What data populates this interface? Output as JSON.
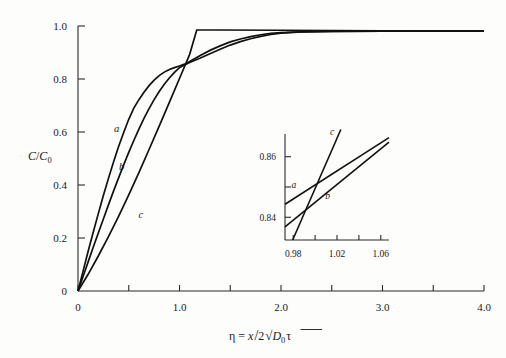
{
  "chart_data": {
    "type": "line",
    "title": "",
    "xlabel": "η = x/2√(D₀τ)",
    "ylabel": "C/C₀",
    "xlim": [
      0,
      4.0
    ],
    "ylim": [
      0,
      1.0
    ],
    "grid": false,
    "legend_position": "inline-curve-labels",
    "x_ticks": [
      {
        "value": 0,
        "label": "0"
      },
      {
        "value": 0.5,
        "label": ""
      },
      {
        "value": 1.0,
        "label": "1.0"
      },
      {
        "value": 1.5,
        "label": ""
      },
      {
        "value": 2.0,
        "label": "2.0"
      },
      {
        "value": 2.5,
        "label": ""
      },
      {
        "value": 3.0,
        "label": "3.0"
      },
      {
        "value": 3.5,
        "label": ""
      },
      {
        "value": 4.0,
        "label": "4.0"
      }
    ],
    "y_ticks": [
      {
        "value": 0,
        "label": "0"
      },
      {
        "value": 0.2,
        "label": "0.2"
      },
      {
        "value": 0.4,
        "label": "0.4"
      },
      {
        "value": 0.6,
        "label": "0.6"
      },
      {
        "value": 0.8,
        "label": "0.8"
      },
      {
        "value": 1.0,
        "label": "1.0"
      }
    ],
    "series": [
      {
        "name": "a",
        "label": "a",
        "label_at": {
          "x": 0.38,
          "y": 0.6
        },
        "points": [
          [
            0.0,
            0.0
          ],
          [
            0.05,
            0.075
          ],
          [
            0.1,
            0.15
          ],
          [
            0.15,
            0.222
          ],
          [
            0.2,
            0.292
          ],
          [
            0.25,
            0.36
          ],
          [
            0.3,
            0.425
          ],
          [
            0.35,
            0.487
          ],
          [
            0.4,
            0.545
          ],
          [
            0.45,
            0.598
          ],
          [
            0.5,
            0.648
          ],
          [
            0.55,
            0.69
          ],
          [
            0.6,
            0.722
          ],
          [
            0.65,
            0.75
          ],
          [
            0.7,
            0.775
          ],
          [
            0.75,
            0.796
          ],
          [
            0.8,
            0.813
          ],
          [
            0.85,
            0.826
          ],
          [
            0.9,
            0.836
          ],
          [
            0.95,
            0.843
          ],
          [
            1.0,
            0.849
          ],
          [
            1.05,
            0.856
          ],
          [
            1.1,
            0.866
          ],
          [
            1.2,
            0.888
          ],
          [
            1.3,
            0.908
          ],
          [
            1.4,
            0.925
          ],
          [
            1.5,
            0.94
          ],
          [
            1.6,
            0.951
          ],
          [
            1.7,
            0.96
          ],
          [
            1.8,
            0.967
          ],
          [
            1.9,
            0.972
          ],
          [
            2.0,
            0.975
          ],
          [
            2.2,
            0.978
          ],
          [
            2.5,
            0.98
          ],
          [
            3.0,
            0.981
          ],
          [
            3.5,
            0.981
          ],
          [
            4.0,
            0.981
          ]
        ]
      },
      {
        "name": "b",
        "label": "b",
        "label_at": {
          "x": 0.43,
          "y": 0.455
        },
        "points": [
          [
            0.0,
            0.0
          ],
          [
            0.05,
            0.055
          ],
          [
            0.1,
            0.11
          ],
          [
            0.15,
            0.165
          ],
          [
            0.2,
            0.219
          ],
          [
            0.25,
            0.272
          ],
          [
            0.3,
            0.325
          ],
          [
            0.35,
            0.377
          ],
          [
            0.4,
            0.427
          ],
          [
            0.45,
            0.476
          ],
          [
            0.5,
            0.523
          ],
          [
            0.55,
            0.568
          ],
          [
            0.6,
            0.611
          ],
          [
            0.65,
            0.651
          ],
          [
            0.7,
            0.688
          ],
          [
            0.75,
            0.722
          ],
          [
            0.8,
            0.753
          ],
          [
            0.85,
            0.78
          ],
          [
            0.9,
            0.804
          ],
          [
            0.95,
            0.825
          ],
          [
            1.0,
            0.843
          ],
          [
            1.05,
            0.853
          ],
          [
            1.1,
            0.862
          ],
          [
            1.2,
            0.878
          ],
          [
            1.3,
            0.895
          ],
          [
            1.4,
            0.912
          ],
          [
            1.5,
            0.928
          ],
          [
            1.6,
            0.941
          ],
          [
            1.7,
            0.952
          ],
          [
            1.8,
            0.961
          ],
          [
            1.9,
            0.968
          ],
          [
            2.0,
            0.973
          ],
          [
            2.2,
            0.978
          ],
          [
            2.5,
            0.98
          ],
          [
            3.0,
            0.981
          ],
          [
            3.5,
            0.981
          ],
          [
            4.0,
            0.981
          ]
        ]
      },
      {
        "name": "c",
        "label": "c",
        "label_at": {
          "x": 0.62,
          "y": 0.275
        },
        "points": [
          [
            0.0,
            0.0
          ],
          [
            0.1,
            0.063
          ],
          [
            0.2,
            0.132
          ],
          [
            0.3,
            0.205
          ],
          [
            0.4,
            0.282
          ],
          [
            0.5,
            0.363
          ],
          [
            0.6,
            0.447
          ],
          [
            0.7,
            0.534
          ],
          [
            0.8,
            0.622
          ],
          [
            0.9,
            0.712
          ],
          [
            1.0,
            0.802
          ],
          [
            1.1,
            0.893
          ],
          [
            1.17,
            0.985
          ],
          [
            1.4,
            0.985
          ],
          [
            2.0,
            0.984
          ],
          [
            3.0,
            0.982
          ],
          [
            4.0,
            0.981
          ]
        ]
      }
    ],
    "inset": {
      "xlim": [
        0.9725,
        1.0675
      ],
      "ylim": [
        0.8325,
        0.8675
      ],
      "x_ticks": [
        {
          "value": 0.98,
          "label": "0.98"
        },
        {
          "value": 1.0,
          "label": ""
        },
        {
          "value": 1.02,
          "label": "1.02"
        },
        {
          "value": 1.04,
          "label": ""
        },
        {
          "value": 1.06,
          "label": "1.06"
        }
      ],
      "y_ticks": [
        {
          "value": 0.84,
          "label": "0.84"
        },
        {
          "value": 0.85,
          "label": ""
        },
        {
          "value": 0.86,
          "label": "0.86"
        }
      ],
      "series": [
        {
          "name": "a",
          "label": "a",
          "label_at": {
            "x": 0.9805,
            "y": 0.8498
          },
          "points": [
            [
              0.9725,
              0.8443
            ],
            [
              1.0675,
              0.8663
            ]
          ]
        },
        {
          "name": "b",
          "label": "b",
          "label_at": {
            "x": 1.0115,
            "y": 0.8462
          },
          "points": [
            [
              0.9725,
              0.8368
            ],
            [
              1.0675,
              0.8648
            ]
          ]
        },
        {
          "name": "c",
          "label": "c",
          "label_at": {
            "x": 1.0155,
            "y": 0.8672
          },
          "points": [
            [
              0.9795,
              0.8325
            ],
            [
              1.0235,
              0.869
            ]
          ]
        }
      ]
    }
  },
  "axis_titles": {
    "y": {
      "numerator": "C",
      "slash": "/",
      "denominator": "C",
      "subscript": "0"
    },
    "x": {
      "eta": "η",
      "equals": "=",
      "x_var": "x",
      "slash": "/",
      "two": "2",
      "radical": "√",
      "d_var": "D",
      "d_sub": "0",
      "tau": "τ"
    }
  }
}
